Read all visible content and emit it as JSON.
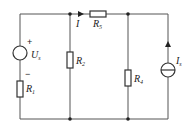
{
  "diagram": {
    "type": "circuit",
    "components": {
      "voltage_source": {
        "label": "U",
        "subscript": "s",
        "plus": "+",
        "minus": "−"
      },
      "r1": {
        "label": "R",
        "subscript": "1"
      },
      "r2": {
        "label": "R",
        "subscript": "2"
      },
      "r4": {
        "label": "R",
        "subscript": "4"
      },
      "r5": {
        "label": "R",
        "subscript": "5"
      },
      "current_source": {
        "label": "I",
        "subscript": "s"
      },
      "current_arrow": {
        "label": "I"
      }
    }
  }
}
